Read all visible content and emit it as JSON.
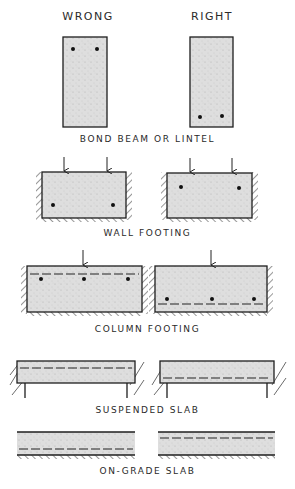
{
  "headers": {
    "wrong": "WRONG",
    "right": "RIGHT"
  },
  "sections": [
    {
      "id": "bond-beam",
      "caption": "BOND BEAM OR LINTEL"
    },
    {
      "id": "wall-footing",
      "caption": "WALL FOOTING"
    },
    {
      "id": "column-footing",
      "caption": "COLUMN FOOTING"
    },
    {
      "id": "suspended-slab",
      "caption": "SUSPENDED SLAB"
    },
    {
      "id": "on-grade-slab",
      "caption": "ON-GRADE SLAB"
    }
  ],
  "colors": {
    "line": "#1e1e1e",
    "concrete": "#dcdcdc",
    "background": "#ffffff"
  }
}
